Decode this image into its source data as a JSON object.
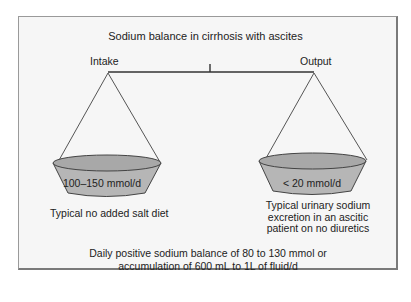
{
  "diagram": {
    "title": "Sodium balance in cirrhosis with ascites",
    "left_pan": {
      "label": "Intake",
      "value": "100–150 mmol/d",
      "caption": "Typical no added salt diet"
    },
    "right_pan": {
      "label": "Output",
      "value": "< 20 mmol/d",
      "caption": "Typical urinary sodium excretion in an ascitic patient on no diuretics"
    },
    "summary": "Daily positive sodium balance of 80 to 130 mmol or accumulation of 600 mL to 1L of fluid/d",
    "colors": {
      "background": "#f6f6f6",
      "bowl_fill": "#b4b4b4",
      "rim_fill": "#a6a6a6",
      "line": "#444444",
      "frame": "#7a7a7a"
    }
  }
}
